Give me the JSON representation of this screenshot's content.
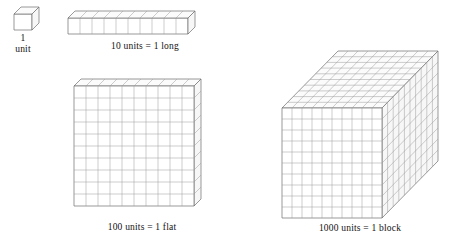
{
  "page": {
    "background_color": "#ffffff",
    "line_color": "#6f6f6f",
    "text_color": "#111111"
  },
  "figures": [
    {
      "id": "unit",
      "name": "unit-cube",
      "caption": "1\nunit",
      "caption_line1": "1",
      "caption_line2": "unit",
      "value": 1,
      "dimensions": {
        "x": 1,
        "y": 1,
        "z": 1
      },
      "shape": "cube"
    },
    {
      "id": "long",
      "name": "ten-long",
      "caption": "10 units = 1 long",
      "value": 10,
      "dimensions": {
        "x": 10,
        "y": 1,
        "z": 1
      },
      "shape": "rod",
      "cells_across": 10
    },
    {
      "id": "flat",
      "name": "hundred-flat",
      "caption": "100 units = 1 flat",
      "value": 100,
      "dimensions": {
        "x": 10,
        "y": 10,
        "z": 1
      },
      "shape": "slab",
      "cells_across": 10,
      "cells_down": 10
    },
    {
      "id": "block",
      "name": "thousand-block",
      "caption": "1000 units = 1 block",
      "value": 1000,
      "dimensions": {
        "x": 10,
        "y": 10,
        "z": 10
      },
      "shape": "cube",
      "cells_across": 10,
      "cells_down": 10,
      "cells_deep": 10
    }
  ]
}
